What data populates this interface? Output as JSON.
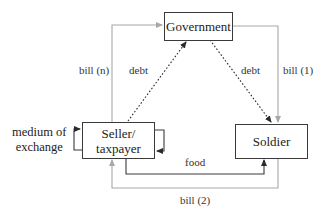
{
  "diagram": {
    "nodes": {
      "government": "Government",
      "seller_line1": "Seller/",
      "seller_line2": "taxpayer",
      "soldier": "Soldier"
    },
    "edges": [
      {
        "from": "Seller/taxpayer",
        "to": "Government",
        "label": "bill (n)",
        "style": "solid-gray"
      },
      {
        "from": "Government",
        "to": "Soldier",
        "label": "bill (1)",
        "style": "solid-gray"
      },
      {
        "from": "Soldier",
        "to": "Seller/taxpayer",
        "label": "bill (2)",
        "style": "solid-gray"
      },
      {
        "from": "Seller/taxpayer",
        "to": "Soldier",
        "label": "food",
        "style": "solid-dark"
      },
      {
        "from": "Seller/taxpayer",
        "to": "Government",
        "label": "debt",
        "style": "dotted"
      },
      {
        "from": "Government",
        "to": "Soldier",
        "label": "debt",
        "style": "dotted"
      },
      {
        "from": "Seller/taxpayer",
        "to": "Seller/taxpayer",
        "label": "medium of exchange",
        "style": "self-loop"
      }
    ],
    "labels": {
      "bill_n": "bill (n)",
      "bill_1": "bill (1)",
      "bill_2": "bill (2)",
      "food": "food",
      "debt_left": "debt",
      "debt_right": "debt",
      "medium_line1": "medium of",
      "medium_line2": "exchange"
    },
    "colors": {
      "gray_line": "#a8a8a8",
      "dark_line": "#3a3a3a"
    }
  }
}
